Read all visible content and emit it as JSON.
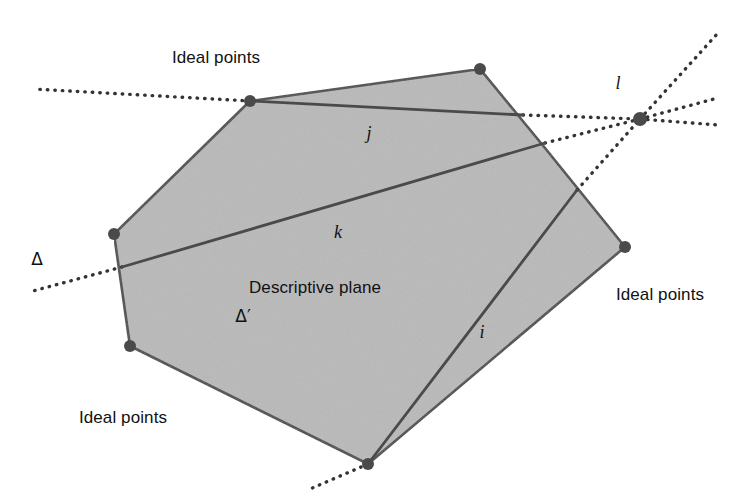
{
  "figure": {
    "type": "geometry-diagram",
    "title_shown": false,
    "background_color": "#ffffff",
    "plane_fill_color": "#b9b9b9",
    "stroke_color": "#444444",
    "dotted_color": "#333333"
  },
  "labels": {
    "ideal_points_top": "Ideal points",
    "ideal_points_left": "Ideal points",
    "ideal_points_right": "Ideal points",
    "descriptive_plane": "Descriptive plane",
    "plane_symbol": "Δ′",
    "delta": "Δ",
    "line_i": "i",
    "line_j": "j",
    "line_k": "k",
    "line_l": "l"
  },
  "label_positions": {
    "ideal_points_top": {
      "x": 216,
      "y": 58
    },
    "ideal_points_left": {
      "x": 123,
      "y": 418
    },
    "ideal_points_right": {
      "x": 660,
      "y": 295
    },
    "descriptive_plane": {
      "x": 315,
      "y": 288
    },
    "plane_symbol": {
      "x": 243,
      "y": 316
    },
    "delta": {
      "x": 37,
      "y": 259
    },
    "line_i": {
      "x": 482,
      "y": 332
    },
    "line_j": {
      "x": 369,
      "y": 133
    },
    "line_k": {
      "x": 338,
      "y": 232
    },
    "line_l": {
      "x": 618,
      "y": 83
    }
  },
  "geometry": {
    "polygon_vertices": [
      {
        "x": 250,
        "y": 101
      },
      {
        "x": 480,
        "y": 69
      },
      {
        "x": 545,
        "y": 148
      },
      {
        "x": 625,
        "y": 247
      },
      {
        "x": 368,
        "y": 464
      },
      {
        "x": 130,
        "y": 346
      },
      {
        "x": 114,
        "y": 234
      }
    ],
    "vertex_dots": [
      {
        "x": 250,
        "y": 101
      },
      {
        "x": 480,
        "y": 69
      },
      {
        "x": 625,
        "y": 247
      },
      {
        "x": 368,
        "y": 464
      },
      {
        "x": 130,
        "y": 346
      },
      {
        "x": 114,
        "y": 234
      }
    ],
    "chords": [
      {
        "name": "j",
        "x1": 250,
        "y1": 101,
        "x2": 523,
        "y2": 115
      },
      {
        "name": "k",
        "x1": 122,
        "y1": 267,
        "x2": 545,
        "y2": 143
      },
      {
        "name": "i",
        "x1": 368,
        "y1": 464,
        "x2": 577,
        "y2": 190
      }
    ],
    "ideal_point": {
      "x": 640,
      "y": 119,
      "radius": 7
    },
    "dotted_rays": [
      {
        "name": "j-left",
        "x1": 250,
        "y1": 101,
        "x2": 33,
        "y2": 89
      },
      {
        "name": "j-right",
        "x1": 523,
        "y1": 115,
        "x2": 640,
        "y2": 119
      },
      {
        "name": "j-beyond",
        "x1": 640,
        "y1": 119,
        "x2": 718,
        "y2": 125
      },
      {
        "name": "k-left",
        "x1": 122,
        "y1": 267,
        "x2": 33,
        "y2": 291
      },
      {
        "name": "k-right",
        "x1": 545,
        "y1": 143,
        "x2": 640,
        "y2": 119
      },
      {
        "name": "k-beyond",
        "x1": 640,
        "y1": 119,
        "x2": 714,
        "y2": 99
      },
      {
        "name": "i-down",
        "x1": 368,
        "y1": 464,
        "x2": 310,
        "y2": 489
      },
      {
        "name": "i-up",
        "x1": 577,
        "y1": 190,
        "x2": 640,
        "y2": 119
      },
      {
        "name": "i-beyond",
        "x1": 640,
        "y1": 119,
        "x2": 718,
        "y2": 33
      }
    ]
  }
}
